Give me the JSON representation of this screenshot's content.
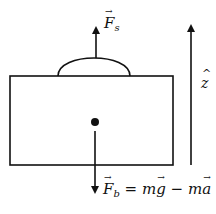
{
  "diagram": {
    "type": "free-body-diagram",
    "colors": {
      "stroke": "#111111",
      "background": "#ffffff"
    },
    "body": {
      "shape": "rectangle",
      "x": 10,
      "y": 76,
      "width": 163,
      "height": 89
    },
    "dome": {
      "x_start": 58,
      "x_end": 130,
      "base_y": 76,
      "peak_y": 58
    },
    "center_of_mass": {
      "cx": 95,
      "cy": 122,
      "r": 4
    },
    "forces": [
      {
        "id": "F_s",
        "direction": "up",
        "symbol": "F",
        "subscript": "s",
        "label": "F_s"
      },
      {
        "id": "F_b",
        "direction": "down",
        "symbol": "F",
        "subscript": "b",
        "equals": "=",
        "rhs_term1_coef": "m",
        "rhs_term1_vec": "g",
        "minus": "−",
        "rhs_term2_coef": "m",
        "rhs_term2_vec": "a",
        "label": "F_b = m g − m a"
      }
    ],
    "axis": {
      "symbol": "z",
      "direction": "up",
      "label": "z-hat"
    }
  }
}
